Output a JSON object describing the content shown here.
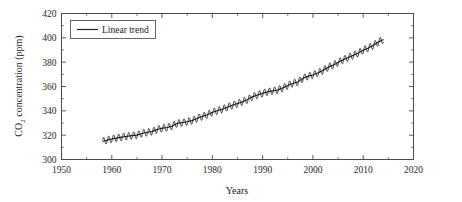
{
  "chart_data": {
    "type": "line",
    "title": "",
    "xlabel": "Years",
    "ylabel": "CO2 concentration (ppm)",
    "ylabel_parts": {
      "pre": "CO",
      "sub": "2",
      "post": " concentration (ppm)"
    },
    "xlim": [
      1950,
      2020
    ],
    "ylim": [
      300,
      420
    ],
    "xticks": [
      1950,
      1960,
      1970,
      1980,
      1990,
      2000,
      2010,
      2020
    ],
    "xticklabels": [
      "1950",
      "1960",
      "1970",
      "1980",
      "1990",
      "2000",
      "2010",
      "2020"
    ],
    "xminor_step": 5,
    "yticks": [
      300,
      320,
      340,
      360,
      380,
      400,
      420
    ],
    "yticklabels": [
      "300",
      "320",
      "340",
      "360",
      "380",
      "400",
      "420"
    ],
    "yminor_step": 10,
    "grid": false,
    "legend": {
      "position": "upper-left",
      "entries": [
        {
          "label": "Linear trend",
          "color": "#1c1c1c",
          "style": "solid-line"
        }
      ]
    },
    "series": [
      {
        "name": "Monthly mean CO2",
        "style": "line-with-seasonal-cycle",
        "color": "#1c1c1c",
        "seasonal_amplitude_ppm": 3.0,
        "x_start": 1958.2,
        "x_end": 2014.0,
        "x": [
          1958.2,
          1959,
          1960,
          1961,
          1962,
          1963,
          1964,
          1965,
          1966,
          1967,
          1968,
          1969,
          1970,
          1971,
          1972,
          1973,
          1974,
          1975,
          1976,
          1977,
          1978,
          1979,
          1980,
          1981,
          1982,
          1983,
          1984,
          1985,
          1986,
          1987,
          1988,
          1989,
          1990,
          1991,
          1992,
          1993,
          1994,
          1995,
          1996,
          1997,
          1998,
          1999,
          2000,
          2001,
          2002,
          2003,
          2004,
          2005,
          2006,
          2007,
          2008,
          2009,
          2010,
          2011,
          2012,
          2013,
          2014
        ],
        "values": [
          315.0,
          315.8,
          316.9,
          317.6,
          318.4,
          319.0,
          319.6,
          320.0,
          321.4,
          322.2,
          323.0,
          324.6,
          325.7,
          326.3,
          327.5,
          329.7,
          330.2,
          331.1,
          332.0,
          333.8,
          335.4,
          336.8,
          338.7,
          340.1,
          341.4,
          343.0,
          344.6,
          346.0,
          347.4,
          349.2,
          351.6,
          353.1,
          354.4,
          355.6,
          356.4,
          357.1,
          358.8,
          360.8,
          362.6,
          363.7,
          366.7,
          368.4,
          369.5,
          371.1,
          373.2,
          375.8,
          377.5,
          379.8,
          381.9,
          383.8,
          385.6,
          387.4,
          389.9,
          391.6,
          393.8,
          396.5,
          398.6
        ]
      }
    ],
    "annotations": []
  },
  "figure": {
    "background": "#ffffff",
    "axis_color": "#4a4a4a",
    "data_color": "#1c1c1c"
  }
}
